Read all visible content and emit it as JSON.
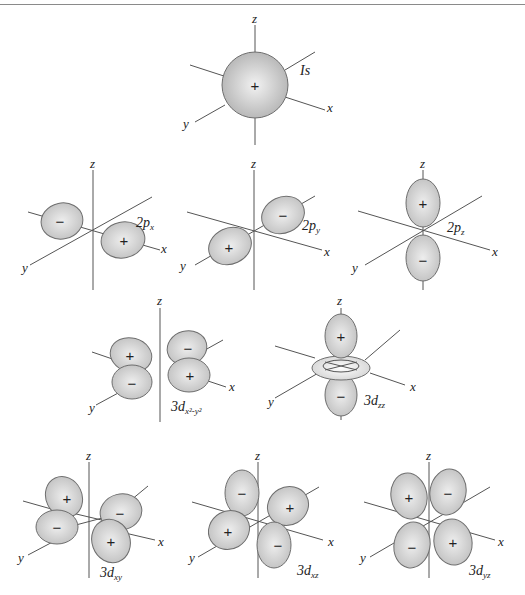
{
  "figure": {
    "colors": {
      "lobe_fill": "#c8c8c8",
      "lobe_highlight": "#f0f0f0",
      "outline": "#6e6e6e",
      "axis": "#555555",
      "text": "#222222"
    },
    "axis_labels": {
      "x": "x",
      "y": "y",
      "z": "z"
    },
    "signs": {
      "plus": "+",
      "minus": "−"
    },
    "orbitals": [
      {
        "id": "1s",
        "label_main": "Is",
        "label_sub": "",
        "lobes": [
          "+"
        ]
      },
      {
        "id": "2px",
        "label_main": "2p",
        "label_sub": "x",
        "lobes": [
          "−",
          "+"
        ]
      },
      {
        "id": "2py",
        "label_main": "2p",
        "label_sub": "y",
        "lobes": [
          "−",
          "+"
        ]
      },
      {
        "id": "2pz",
        "label_main": "2p",
        "label_sub": "z",
        "lobes": [
          "+",
          "−"
        ]
      },
      {
        "id": "3dx2y2",
        "label_main": "3d",
        "label_sub": "x²-y²",
        "lobes": [
          "+",
          "−",
          "−",
          "+"
        ]
      },
      {
        "id": "3dz2",
        "label_main": "3d",
        "label_sub": "zz",
        "lobes": [
          "+",
          "−"
        ]
      },
      {
        "id": "3dxy",
        "label_main": "3d",
        "label_sub": "xy",
        "lobes": [
          "+",
          "−",
          "−",
          "+"
        ]
      },
      {
        "id": "3dxz",
        "label_main": "3d",
        "label_sub": "xz",
        "lobes": [
          "−",
          "+",
          "+",
          "−"
        ]
      },
      {
        "id": "3dyz",
        "label_main": "3d",
        "label_sub": "yz",
        "lobes": [
          "+",
          "−",
          "−",
          "+"
        ]
      }
    ]
  }
}
